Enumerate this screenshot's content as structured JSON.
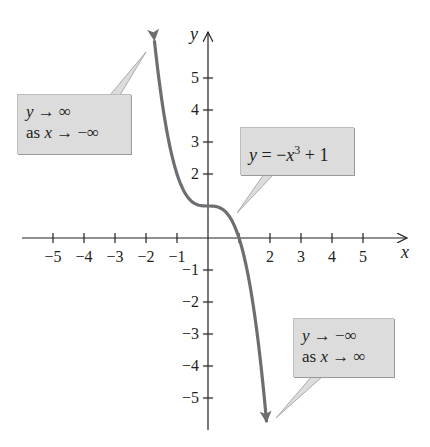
{
  "chart_data": {
    "type": "line",
    "title": "",
    "function": "y = -x^3 + 1",
    "xlabel": "x",
    "ylabel": "y",
    "xlim": [
      -5.8,
      6.4
    ],
    "ylim": [
      -6.1,
      6.6
    ],
    "grid": false,
    "x_ticks": [
      -5,
      -4,
      -3,
      -2,
      -1,
      1,
      2,
      3,
      4,
      5
    ],
    "x_tick_labels": [
      "−5",
      "−4",
      "−3",
      "−2",
      "−1",
      "",
      "2",
      "3",
      "4",
      "5"
    ],
    "y_ticks": [
      -5,
      -4,
      -3,
      -2,
      -1,
      1,
      2,
      3,
      4,
      5
    ],
    "y_tick_labels": [
      "−5",
      "−4",
      "−3",
      "−2",
      "−1",
      "",
      "2",
      "3",
      "4",
      "5"
    ],
    "series": [
      {
        "name": "y = -x^3 + 1",
        "color": "#6d6e71",
        "arrows_both_ends": true,
        "x": [
          -1.73,
          -1.6,
          -1.4,
          -1.2,
          -1.0,
          -0.8,
          -0.6,
          -0.4,
          -0.2,
          0,
          0.2,
          0.4,
          0.6,
          0.8,
          1.0,
          1.2,
          1.4,
          1.6,
          1.8,
          1.89
        ],
        "y": [
          6.178,
          5.096,
          3.744,
          2.728,
          2.0,
          1.512,
          1.216,
          1.064,
          1.008,
          1.0,
          0.992,
          0.936,
          0.784,
          0.488,
          0.0,
          -0.728,
          -1.744,
          -3.096,
          -4.832,
          -5.751
        ]
      }
    ],
    "annotations": [
      {
        "id": "left",
        "line1": "y → ∞",
        "line2": "as x → −∞"
      },
      {
        "id": "mid",
        "text": "y = −x³ + 1"
      },
      {
        "id": "right",
        "line1": "y → −∞",
        "line2": "as x → ∞"
      }
    ]
  },
  "callouts": {
    "left": {
      "y": "y",
      "arrow1": " → ∞",
      "as": "as ",
      "x": "x",
      "arrow2": " → −∞"
    },
    "mid": {
      "y": "y",
      "eq": " = −",
      "x": "x",
      "exp": "3",
      "rest": " + 1"
    },
    "right": {
      "y": "y",
      "arrow1": " → −∞",
      "as": "as ",
      "x": "x",
      "arrow2": " → ∞"
    }
  },
  "layout": {
    "origin_px": [
      208,
      238
    ],
    "unit_x_px": 31,
    "unit_y_px": 32
  }
}
